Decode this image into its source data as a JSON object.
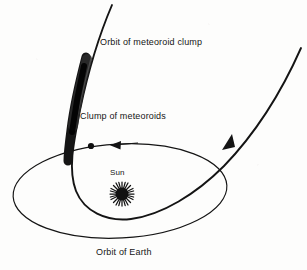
{
  "figure": {
    "background_color": "#fdfdfc",
    "ink_color": "#111111"
  },
  "labels": {
    "orbit_of_meteoroid_clump": "Orbit of meteoroid clump",
    "clump_of_meteoroids": "Clump of meteoroids",
    "sun": "Sun",
    "orbit_of_earth": "Orbit of Earth"
  },
  "elements": {
    "sun_symbol": "sun-icon",
    "earth_marker": "earth-dot-icon",
    "earth_direction_arrow": "arrow-left-icon",
    "meteoroid_direction_arrow": "arrow-up-right-icon",
    "meteoroid_clump_blob": "clump-blob",
    "earth_orbit_ellipse": "ellipse-path",
    "meteoroid_orbit_curve": "parabolic-path"
  },
  "geometry": {
    "earth_orbit": {
      "shape": "ellipse",
      "center_x": 120,
      "center_y": 191,
      "radius_x": 107,
      "radius_y": 47,
      "rotation_deg": -3
    },
    "sun_position": {
      "x": 122,
      "y": 194,
      "radius": 7
    },
    "earth_position": {
      "x": 91,
      "y": 146
    },
    "clump_span": {
      "x1": 80,
      "y1": 57,
      "x2": 70,
      "y2": 160
    }
  }
}
